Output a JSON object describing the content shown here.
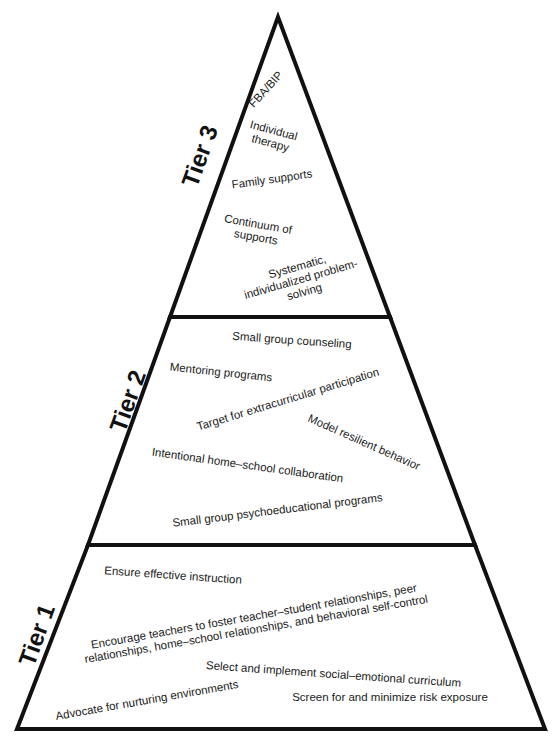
{
  "colors": {
    "stroke": "#111111",
    "text": "#1a1a1a",
    "background": "#ffffff"
  },
  "tiers": [
    {
      "label": "Tier 3",
      "items": [
        "FBA/BIP",
        "Individual\ntherapy",
        "Family supports",
        "Continuum of\nsupports",
        "Systematic,\nindividualized problem-\nsolving"
      ]
    },
    {
      "label": "Tier 2",
      "items": [
        "Small group counseling",
        "Mentoring programs",
        "Target for extracurricular participation",
        "Model resilient behavior",
        "Intentional home–school collaboration",
        "Small group psychoeducational programs"
      ]
    },
    {
      "label": "Tier 1",
      "items": [
        "Ensure effective instruction",
        "Encourage teachers to foster teacher–student relationships, peer\nrelationships, home–school relationships, and behavioral self-control",
        "Select and implement social–emotional curriculum",
        "Advocate for nurturing environments",
        "Screen for and minimize risk exposure"
      ]
    }
  ]
}
